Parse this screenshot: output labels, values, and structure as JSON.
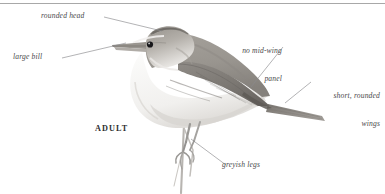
{
  "plate": {
    "title": "Adult warbler field-guide plate",
    "caption": "ADULT",
    "background_color": "#ffffff",
    "rule_color": "#a8a8a8"
  },
  "annotations": [
    {
      "id": "rounded-head",
      "text": "rounded head",
      "lines": [
        "rounded head"
      ]
    },
    {
      "id": "large-bill",
      "text": "large bill",
      "lines": [
        "large bill"
      ]
    },
    {
      "id": "no-mid-wing",
      "text": "no mid-wing panel",
      "lines": [
        "no mid-wing",
        "panel"
      ]
    },
    {
      "id": "short-wings",
      "text": "short, rounded wings",
      "lines": [
        "short, rounded",
        "wings"
      ]
    },
    {
      "id": "greyish-legs",
      "text": "greyish legs",
      "lines": [
        "greyish legs"
      ]
    }
  ],
  "labels": {
    "rounded_head": "rounded head",
    "large_bill": "large bill",
    "no_mid_wing_line1": "no mid-wing",
    "no_mid_wing_line2": "panel",
    "short_wings_line1": "short, rounded",
    "short_wings_line2": "wings",
    "greyish_legs": "greyish legs"
  },
  "illustration": {
    "subject": "perched warbler, side profile facing left",
    "colors": {
      "upperparts": "#9b9791",
      "upperparts_dark": "#7e7a75",
      "wing_shadow": "#6f6b67",
      "underparts": "#f4f3f1",
      "underparts_shade": "#dedbd7",
      "crown_dark": "#6e6a66",
      "eye": "#1b1b1d",
      "bill": "#8d8984",
      "legs": "#9c9a97",
      "perch": "#b5b2ae",
      "leader_line": "#8a8a8c"
    }
  }
}
